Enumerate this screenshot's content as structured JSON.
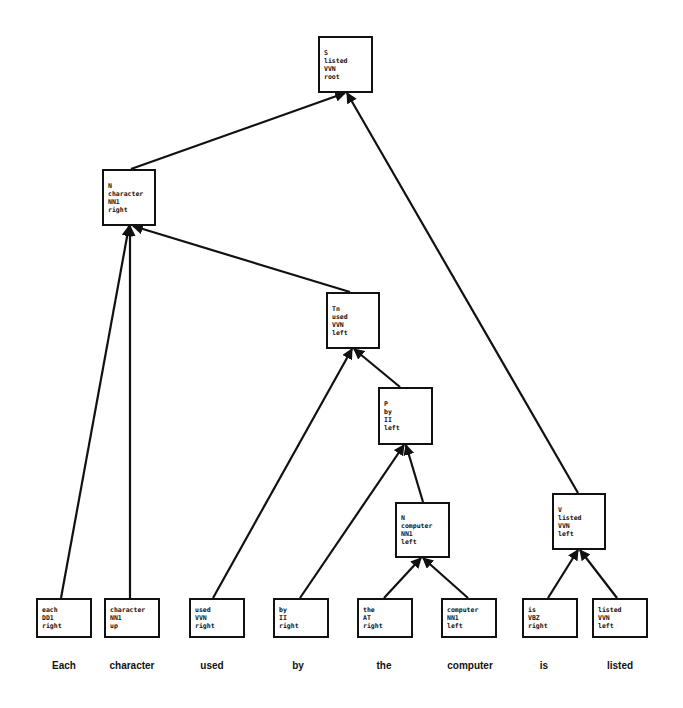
{
  "diagram": {
    "type": "dependency-tree",
    "nodes": [
      {
        "id": "root",
        "lines": [
          "S",
          "listed",
          "VVN",
          "root"
        ],
        "x": 318,
        "y": 36,
        "w": 55,
        "h": 57
      },
      {
        "id": "n_character",
        "lines": [
          "N",
          "character",
          "NN1",
          "right"
        ],
        "x": 102,
        "y": 169,
        "w": 54,
        "h": 57
      },
      {
        "id": "tn_used",
        "lines": [
          "Tn",
          "used",
          "VVN",
          "left"
        ],
        "x": 326,
        "y": 292,
        "w": 54,
        "h": 57
      },
      {
        "id": "p_by",
        "lines": [
          "P",
          "by",
          "II",
          "left"
        ],
        "x": 378,
        "y": 387,
        "w": 55,
        "h": 58
      },
      {
        "id": "n_computer",
        "lines": [
          "N",
          "computer",
          "NN1",
          "left"
        ],
        "x": 395,
        "y": 502,
        "w": 55,
        "h": 56
      },
      {
        "id": "v_listed",
        "lines": [
          "V",
          "listed",
          "VVN",
          "left"
        ],
        "x": 552,
        "y": 493,
        "w": 54,
        "h": 57
      },
      {
        "id": "leaf_each",
        "lines": [
          "each",
          "DD1",
          "right"
        ],
        "x": 36,
        "y": 598,
        "w": 56,
        "h": 40
      },
      {
        "id": "leaf_character",
        "lines": [
          "character",
          "NN1",
          "up"
        ],
        "x": 104,
        "y": 598,
        "w": 56,
        "h": 40
      },
      {
        "id": "leaf_used",
        "lines": [
          "used",
          "VVN",
          "right"
        ],
        "x": 189,
        "y": 598,
        "w": 56,
        "h": 40
      },
      {
        "id": "leaf_by",
        "lines": [
          "by",
          "II",
          "right"
        ],
        "x": 273,
        "y": 598,
        "w": 56,
        "h": 40
      },
      {
        "id": "leaf_the",
        "lines": [
          "the",
          "AT",
          "right"
        ],
        "x": 357,
        "y": 598,
        "w": 56,
        "h": 40
      },
      {
        "id": "leaf_computer",
        "lines": [
          "computer",
          "NN1",
          "left"
        ],
        "x": 441,
        "y": 598,
        "w": 56,
        "h": 40
      },
      {
        "id": "leaf_is",
        "lines": [
          "is",
          "VBZ",
          "right"
        ],
        "x": 522,
        "y": 598,
        "w": 56,
        "h": 40
      },
      {
        "id": "leaf_listed",
        "lines": [
          "listed",
          "VVN",
          "left"
        ],
        "x": 592,
        "y": 598,
        "w": 56,
        "h": 40
      }
    ],
    "edges": [
      {
        "from": "n_character",
        "to": "root",
        "x1": 131,
        "y1": 169,
        "x2": 345,
        "y2": 93
      },
      {
        "from": "v_listed",
        "to": "root",
        "x1": 578,
        "y1": 493,
        "x2": 347,
        "y2": 93
      },
      {
        "from": "tn_used",
        "to": "n_character",
        "x1": 350,
        "y1": 292,
        "x2": 133,
        "y2": 226
      },
      {
        "from": "leaf_each",
        "to": "n_character",
        "x1": 61,
        "y1": 598,
        "x2": 129,
        "y2": 226
      },
      {
        "from": "leaf_character",
        "to": "n_character",
        "x1": 130,
        "y1": 598,
        "x2": 130,
        "y2": 226
      },
      {
        "from": "leaf_used",
        "to": "tn_used",
        "x1": 213,
        "y1": 598,
        "x2": 352,
        "y2": 349
      },
      {
        "from": "p_by",
        "to": "tn_used",
        "x1": 400,
        "y1": 387,
        "x2": 354,
        "y2": 349
      },
      {
        "from": "leaf_by",
        "to": "p_by",
        "x1": 300,
        "y1": 598,
        "x2": 404,
        "y2": 445
      },
      {
        "from": "n_computer",
        "to": "p_by",
        "x1": 423,
        "y1": 502,
        "x2": 406,
        "y2": 445
      },
      {
        "from": "leaf_the",
        "to": "n_computer",
        "x1": 384,
        "y1": 598,
        "x2": 421,
        "y2": 558
      },
      {
        "from": "leaf_computer",
        "to": "n_computer",
        "x1": 468,
        "y1": 598,
        "x2": 423,
        "y2": 558
      },
      {
        "from": "leaf_is",
        "to": "v_listed",
        "x1": 548,
        "y1": 598,
        "x2": 578,
        "y2": 550
      },
      {
        "from": "leaf_listed",
        "to": "v_listed",
        "x1": 617,
        "y1": 598,
        "x2": 580,
        "y2": 550
      }
    ],
    "sentence": [
      {
        "word": "Each",
        "cx": 64
      },
      {
        "word": "character",
        "cx": 132
      },
      {
        "word": "used",
        "cx": 212
      },
      {
        "word": "by",
        "cx": 298
      },
      {
        "word": "the",
        "cx": 384
      },
      {
        "word": "computer",
        "cx": 470
      },
      {
        "word": "is",
        "cx": 544
      },
      {
        "word": "listed",
        "cx": 620
      }
    ]
  },
  "colors": {
    "line": "#111111",
    "background": "#ffffff"
  }
}
